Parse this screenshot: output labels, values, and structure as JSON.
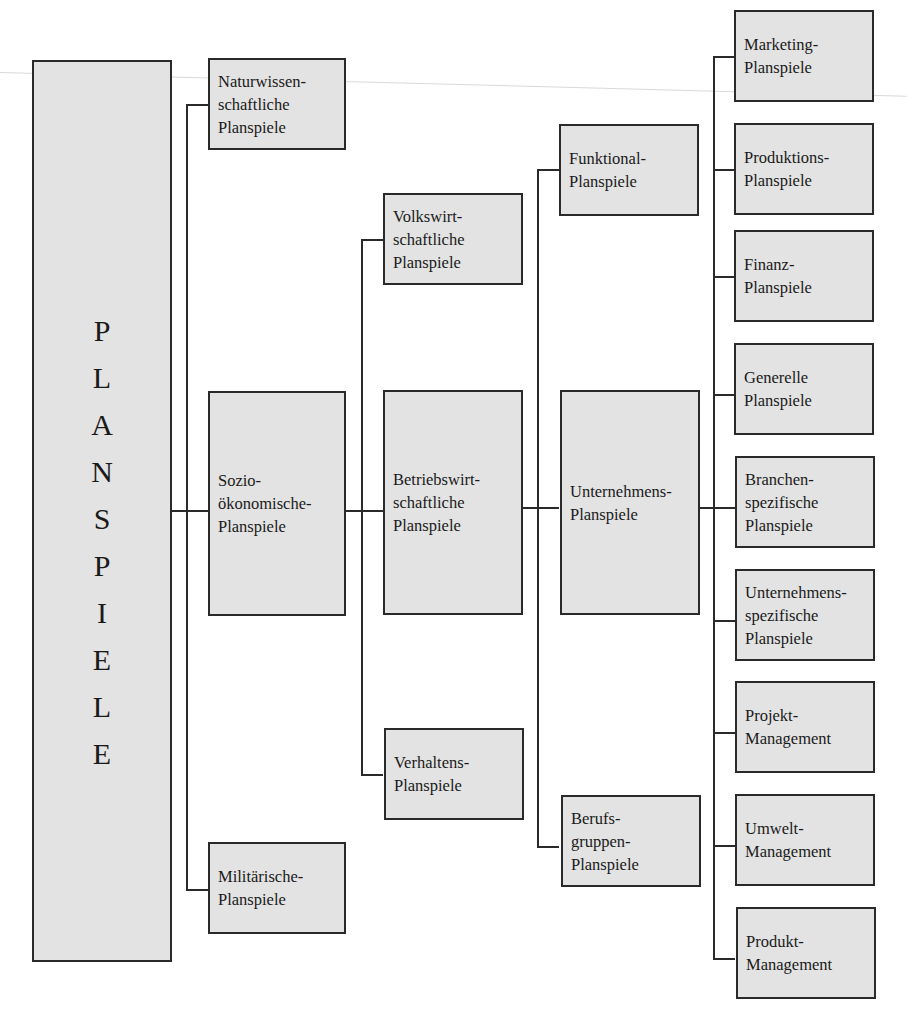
{
  "diagram": {
    "root": {
      "label": "PLANSPIELE",
      "letters": [
        "P",
        "L",
        "A",
        "N",
        "S",
        "P",
        "I",
        "E",
        "L",
        "E"
      ]
    },
    "level1": [
      {
        "id": "naturwissenschaftliche",
        "lines": [
          "Naturwissen-",
          "schaftliche",
          "Planspiele"
        ]
      },
      {
        "id": "soziooekonomische",
        "lines": [
          "Sozio-",
          "ökonomische-",
          "Planspiele"
        ]
      },
      {
        "id": "militaerische",
        "lines": [
          "Militärische-",
          "Planspiele"
        ]
      }
    ],
    "level2": [
      {
        "id": "volkswirtschaftliche",
        "parent": "soziooekonomische",
        "lines": [
          "Volkswirt-",
          "schaftliche",
          "Planspiele"
        ]
      },
      {
        "id": "betriebswirtschaftliche",
        "parent": "soziooekonomische",
        "lines": [
          "Betriebswirt-",
          "schaftliche",
          "Planspiele"
        ]
      },
      {
        "id": "verhaltens",
        "parent": "soziooekonomische",
        "lines": [
          "Verhaltens-",
          "Planspiele"
        ]
      }
    ],
    "level3": [
      {
        "id": "funktional",
        "parent": "betriebswirtschaftliche",
        "lines": [
          "Funktional-",
          "Planspiele"
        ]
      },
      {
        "id": "unternehmens",
        "parent": "betriebswirtschaftliche",
        "lines": [
          "Unternehmens-",
          "Planspiele"
        ]
      },
      {
        "id": "berufsgruppen",
        "parent": "betriebswirtschaftliche",
        "lines": [
          "Berufs-",
          "gruppen-",
          "Planspiele"
        ]
      }
    ],
    "level4": [
      {
        "id": "marketing",
        "parent": "unternehmens",
        "lines": [
          "Marketing-",
          "Planspiele"
        ]
      },
      {
        "id": "produktions",
        "parent": "unternehmens",
        "lines": [
          "Produktions-",
          "Planspiele"
        ]
      },
      {
        "id": "finanz",
        "parent": "unternehmens",
        "lines": [
          "Finanz-",
          "Planspiele"
        ]
      },
      {
        "id": "generelle",
        "parent": "unternehmens",
        "lines": [
          "Generelle",
          "Planspiele"
        ]
      },
      {
        "id": "branchenspezifische",
        "parent": "unternehmens",
        "lines": [
          "Branchen-",
          "spezifische",
          "Planspiele"
        ]
      },
      {
        "id": "unternehmensspezifische",
        "parent": "unternehmens",
        "lines": [
          "Unternehmens-",
          "spezifische",
          "Planspiele"
        ]
      },
      {
        "id": "projekt-management",
        "parent": "unternehmens",
        "lines": [
          "Projekt-",
          "Management"
        ]
      },
      {
        "id": "umwelt-management",
        "parent": "unternehmens",
        "lines": [
          "Umwelt-",
          "Management"
        ]
      },
      {
        "id": "produkt-management",
        "parent": "unternehmens",
        "lines": [
          "Produkt-",
          "Management"
        ]
      }
    ],
    "caption": "",
    "colors": {
      "box_fill": "#e3e3e3",
      "border": "#2a2a2a",
      "text": "#1a1a1a",
      "background": "#ffffff"
    }
  }
}
